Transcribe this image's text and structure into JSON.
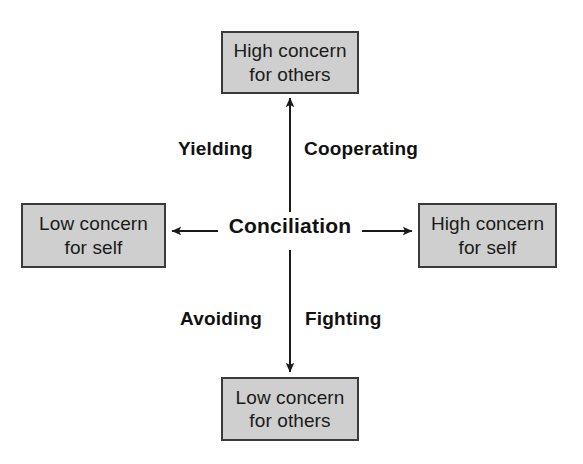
{
  "diagram": {
    "title": "Conciliation",
    "type": "two-axis-quadrant",
    "center": {
      "label": "Conciliation"
    },
    "colors": {
      "box_fill": "#cfcfcf",
      "box_border": "#3a3a3a",
      "arrow": "#1a1a1a",
      "text": "#111111",
      "background": "#ffffff"
    },
    "nodes": [
      {
        "id": "high-concern-others",
        "position": "top",
        "line1": "High concern",
        "line2": "for others"
      },
      {
        "id": "low-concern-self",
        "position": "left",
        "line1": "Low concern",
        "line2": "for self"
      },
      {
        "id": "high-concern-self",
        "position": "right",
        "line1": "High concern",
        "line2": "for self"
      },
      {
        "id": "low-concern-others",
        "position": "bottom",
        "line1": "Low concern",
        "line2": "for others"
      }
    ],
    "quadrant_labels": [
      {
        "id": "yielding",
        "label": "Yielding",
        "quadrant": "upper-left"
      },
      {
        "id": "cooperating",
        "label": "Cooperating",
        "quadrant": "upper-right"
      },
      {
        "id": "avoiding",
        "label": "Avoiding",
        "quadrant": "lower-left"
      },
      {
        "id": "fighting",
        "label": "Fighting",
        "quadrant": "lower-right"
      }
    ],
    "arrows": [
      {
        "id": "arrow-up",
        "from": "center",
        "to": "high-concern-others"
      },
      {
        "id": "arrow-left",
        "from": "center",
        "to": "low-concern-self"
      },
      {
        "id": "arrow-right",
        "from": "center",
        "to": "high-concern-self"
      },
      {
        "id": "arrow-down",
        "from": "center",
        "to": "low-concern-others"
      }
    ]
  }
}
